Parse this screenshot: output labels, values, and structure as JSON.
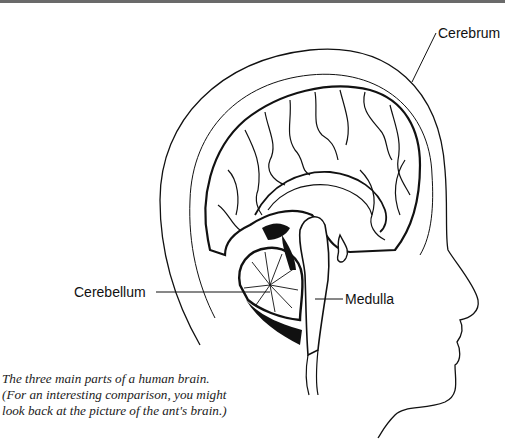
{
  "figure": {
    "labels": {
      "cerebrum": "Cerebrum",
      "cerebellum": "Cerebellum",
      "medulla": "Medulla"
    },
    "caption": {
      "lines": [
        "The three main parts of a human brain.",
        "(For an interesting comparison, you might",
        "look back at the picture of the ant's brain.)"
      ]
    },
    "colors": {
      "ink": "#111111",
      "background": "#ffffff",
      "top_border": "#6a6a6a"
    }
  }
}
